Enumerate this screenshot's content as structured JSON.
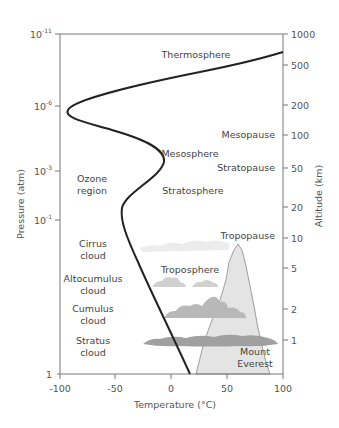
{
  "diagram": {
    "title": "",
    "axes": {
      "x_label": "Temperature (°C)",
      "x_ticks": [
        "-100",
        "-50",
        "0",
        "50",
        "100"
      ],
      "left_label": "Pressure (atm)",
      "left_ticks": [
        {
          "base": "10",
          "exp": "-11"
        },
        {
          "base": "10",
          "exp": "-6"
        },
        {
          "base": "10",
          "exp": "-3"
        },
        {
          "base": "10",
          "exp": "-1"
        },
        {
          "base": "1",
          "exp": ""
        }
      ],
      "right_label": "Altitude (km)",
      "right_ticks": [
        "1000",
        "500",
        "200",
        "100",
        "50",
        "20",
        "10",
        "5",
        "2",
        "1"
      ]
    },
    "layer_labels": {
      "thermosphere": "Thermosphere",
      "mesopause": "Mesopause",
      "mesosphere": "Mesosphere",
      "stratopause": "Stratopause",
      "stratosphere": "Stratosphere",
      "tropopause": "Tropopause",
      "troposphere": "Troposphere"
    },
    "region_labels": {
      "ozone_line1": "Ozone",
      "ozone_line2": "region",
      "cirrus_line1": "Cirrus",
      "cirrus_line2": "cloud",
      "altocumulus_line1": "Altocumulus",
      "altocumulus_line2": "cloud",
      "cumulus_line1": "Cumulus",
      "cumulus_line2": "cloud",
      "stratus_line1": "Stratus",
      "stratus_line2": "cloud",
      "everest_line1": "Mount",
      "everest_line2": "Everest"
    },
    "colors": {
      "curve": "#222222",
      "axis": "#777777",
      "mountain_fill": "#e2e2e2",
      "cloud_light": "#d4d4d4",
      "cloud_mid": "#b4b4b4",
      "cloud_dark": "#9c9c9c"
    }
  }
}
